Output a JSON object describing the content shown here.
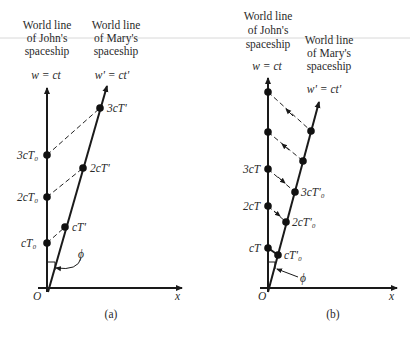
{
  "figure": {
    "panels": [
      {
        "id": "a",
        "caption": "(a)",
        "john_header": [
          "World line",
          "of John's",
          "spaceship"
        ],
        "mary_header": [
          "World line",
          "of Mary's",
          "spaceship"
        ],
        "john_axis_label": "w = ct",
        "mary_axis_label": "w' = ct'",
        "origin_label": "O",
        "x_axis_label": "x",
        "angle_label": "ϕ",
        "john_events": [
          "3cT₀",
          "2cT₀",
          "cT₀"
        ],
        "mary_events": [
          "3cT'",
          "2cT'",
          "cT'"
        ],
        "signal_direction": "none (dashed simultaneity lines)"
      },
      {
        "id": "b",
        "caption": "(b)",
        "john_header": [
          "World line",
          "of John's",
          "spaceship"
        ],
        "mary_header": [
          "World line",
          "of Mary's",
          "spaceship"
        ],
        "john_axis_label": "w = ct",
        "mary_axis_label": "w' = ct'",
        "origin_label": "O",
        "x_axis_label": "x",
        "angle_label": "ϕ",
        "john_events": [
          "3cT",
          "2cT",
          "cT"
        ],
        "mary_events": [
          "3cT'₀",
          "2cT'₀",
          "cT'₀"
        ],
        "signal_direction": "arrows on dashed lines"
      }
    ]
  }
}
